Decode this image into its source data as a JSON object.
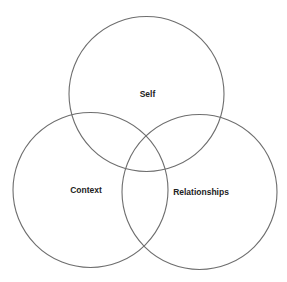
{
  "diagram": {
    "type": "venn",
    "circles": [
      {
        "id": "self",
        "label": "Self",
        "cx": 146.5,
        "cy": 94,
        "r": 77.5,
        "label_x": 147.5,
        "label_y": 95
      },
      {
        "id": "context",
        "label": "Context",
        "cx": 90.5,
        "cy": 190,
        "r": 77.5,
        "label_x": 86,
        "label_y": 191
      },
      {
        "id": "relationships",
        "label": "Relationships",
        "cx": 199.5,
        "cy": 192,
        "r": 77.5,
        "label_x": 201,
        "label_y": 193
      }
    ],
    "colors": {
      "stroke": "#6e6e6e",
      "text": "#222222",
      "background": "#ffffff"
    }
  }
}
